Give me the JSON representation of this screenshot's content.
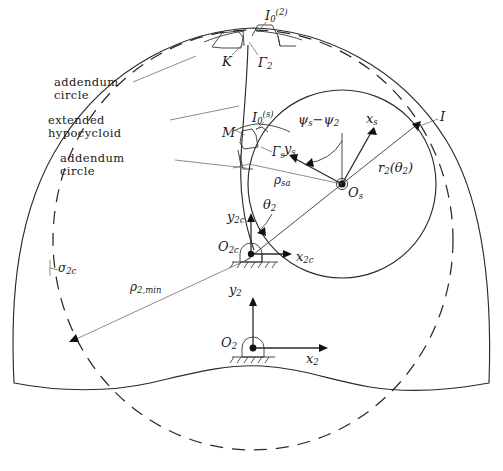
{
  "figure": {
    "kind": "engineering-geometry-diagram",
    "background": "#ffffff",
    "ink": "#2a2a2a",
    "width": 503,
    "height": 471
  },
  "text_labels": {
    "addendum_circle_upper_line1": "addendum",
    "addendum_circle_upper_line2": "circle",
    "extended_hypocycloid_line1": "extended",
    "extended_hypocycloid_line2": "hypocycloid",
    "addendum_circle_lower_line1": "addendum",
    "addendum_circle_lower_line2": "circle"
  },
  "math_labels": {
    "I0_2_base": "I",
    "I0_2_sub": "0",
    "I0_2_sup": "(2)",
    "K": "K",
    "Gamma_2_base": "Γ",
    "Gamma_2_sub": "2",
    "I0_s_base": "I",
    "I0_s_sub": "0",
    "I0_s_sup": "(s)",
    "M": "M",
    "Gamma_s_base": "Γ",
    "Gamma_s_sub": "s",
    "psi_diff": "ψ",
    "psi_diff_sub_s": "s",
    "psi_diff_minus": "−",
    "psi_diff_sub_2": "2",
    "x_s_base": "x",
    "x_s_sub": "s",
    "y_s_base": "y",
    "y_s_sub": "s",
    "I_point": "I",
    "r2_base": "r",
    "r2_sub": "2",
    "r2_arg_open": "(θ",
    "r2_arg_sub": "2",
    "r2_arg_close": ")",
    "rho_sa_base": "ρ",
    "rho_sa_sub": "sa",
    "O_s_base": "O",
    "O_s_sub": "s",
    "theta_2_base": "θ",
    "theta_2_sub": "2",
    "y_2c_base": "y",
    "y_2c_sub": "2c",
    "O_2c_base": "O",
    "O_2c_sub": "2c",
    "x_2c_base": "x",
    "x_2c_sub": "2c",
    "sigma_2c_base": "σ",
    "sigma_2c_sub": "2c",
    "rho_2min_base": "ρ",
    "rho_2min_sub": "2,min",
    "y_2_base": "y",
    "y_2_sub": "2",
    "O_2_base": "O",
    "O_2_sub": "2",
    "x_2_base": "x",
    "x_2_sub": "2"
  },
  "geometry": {
    "outer_profile_note": "solid closed curve, dome-like outer workpiece boundary",
    "addendum_circle_dashed_note": "large dashed circle, centre near O_2",
    "rolling_circle_note": "solid circle centred at O_s",
    "frames": [
      {
        "name": "O_s",
        "x": 342,
        "y": 184,
        "axes": [
          "x_s",
          "y_s"
        ]
      },
      {
        "name": "O_2c",
        "x": 251,
        "y": 254,
        "axes": [
          "x_2c",
          "y_2c"
        ],
        "ground": true
      },
      {
        "name": "O_2",
        "x": 253,
        "y": 348,
        "axes": [
          "x_2",
          "y_2"
        ],
        "ground": true
      }
    ],
    "angles": [
      "psi_s-psi_2",
      "theta_2"
    ],
    "dimensions": [
      "r_2(theta_2)",
      "rho_sa",
      "rho_2,min",
      "sigma_2c"
    ],
    "marked_points": [
      "I_0^(2)",
      "K",
      "Gamma_2",
      "I_0^(s)",
      "M",
      "Gamma_s",
      "I"
    ]
  }
}
